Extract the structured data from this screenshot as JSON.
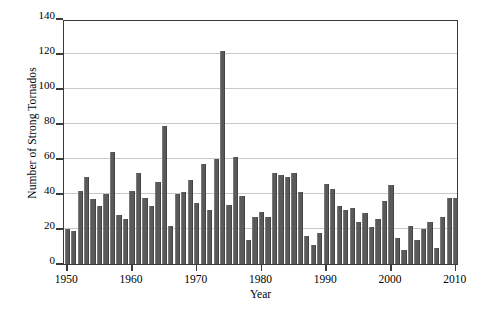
{
  "chart_data": {
    "type": "bar",
    "title": "",
    "xlabel": "Year",
    "ylabel": "Number of Strong Tornados",
    "xlim": [
      1949.5,
      2010.5
    ],
    "ylim": [
      0,
      140
    ],
    "ytick_values": [
      0,
      20,
      40,
      60,
      80,
      100,
      120,
      140
    ],
    "ytick_labels": [
      "0",
      "20",
      "40",
      "60",
      "80",
      "100",
      "120",
      "140"
    ],
    "xtick_values": [
      1950,
      1960,
      1970,
      1980,
      1990,
      2000,
      2010
    ],
    "xtick_labels": [
      "1950",
      "1960",
      "1970",
      "1980",
      "1990",
      "2000",
      "2010"
    ],
    "grid": "horizontal",
    "legend": null,
    "bar_color": "#5a5a5a",
    "categories": [
      1950,
      1951,
      1952,
      1953,
      1954,
      1955,
      1956,
      1957,
      1958,
      1959,
      1960,
      1961,
      1962,
      1963,
      1964,
      1965,
      1966,
      1967,
      1968,
      1969,
      1970,
      1971,
      1972,
      1973,
      1974,
      1975,
      1976,
      1977,
      1978,
      1979,
      1980,
      1981,
      1982,
      1983,
      1984,
      1985,
      1986,
      1987,
      1988,
      1989,
      1990,
      1991,
      1992,
      1993,
      1994,
      1995,
      1996,
      1997,
      1998,
      1999,
      2000,
      2001,
      2002,
      2003,
      2004,
      2005,
      2006,
      2007,
      2008,
      2009,
      2010
    ],
    "values": [
      20,
      19,
      42,
      50,
      37,
      33,
      40,
      64,
      28,
      26,
      42,
      52,
      38,
      33,
      47,
      79,
      22,
      40,
      41,
      48,
      35,
      57,
      31,
      60,
      122,
      34,
      61,
      39,
      14,
      27,
      30,
      27,
      52,
      51,
      50,
      52,
      41,
      16,
      11,
      18,
      46,
      43,
      33,
      31,
      32,
      24,
      29,
      21,
      26,
      36,
      45,
      15,
      8,
      22,
      14,
      20,
      24,
      9,
      27,
      38,
      38
    ]
  },
  "figure": {
    "caption_strip": ""
  }
}
